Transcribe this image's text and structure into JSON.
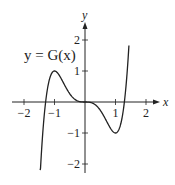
{
  "chart_data": {
    "type": "line",
    "title": "",
    "xlabel": "x",
    "ylabel": "y",
    "xlim": [
      -2.4,
      2.5
    ],
    "ylim": [
      -2.3,
      2.6
    ],
    "x_ticks": [
      -2,
      -1,
      1,
      2
    ],
    "y_ticks": [
      -2,
      -1,
      1,
      2
    ],
    "x_tick_labels": [
      "−2",
      "−1",
      "1",
      "2"
    ],
    "y_tick_labels": [
      "−2",
      "−1",
      "1",
      "2"
    ],
    "grid": false,
    "annotation": "y = G(x)",
    "series": [
      {
        "name": "G(x)",
        "formula": "1.5x^5 - 2.5x^3",
        "key_points": [
          {
            "x": -1.47,
            "y": -2.2,
            "note": "lower-left endpoint"
          },
          {
            "x": -1.29,
            "y": 0,
            "note": "x-intercept"
          },
          {
            "x": -1,
            "y": 1,
            "note": "local maximum"
          },
          {
            "x": 0,
            "y": 0,
            "note": "horizontal inflection"
          },
          {
            "x": 1,
            "y": -1,
            "note": "local minimum"
          },
          {
            "x": 1.29,
            "y": 0,
            "note": "x-intercept"
          },
          {
            "x": 1.44,
            "y": 2.6,
            "note": "upper-right endpoint"
          }
        ],
        "x_range": [
          -1.47,
          1.44
        ]
      }
    ]
  },
  "labels": {
    "x_axis": "x",
    "y_axis": "y",
    "function": "y = G(x)"
  },
  "colors": {
    "axis": "#222222",
    "curve": "#222222",
    "background": "#ffffff"
  }
}
